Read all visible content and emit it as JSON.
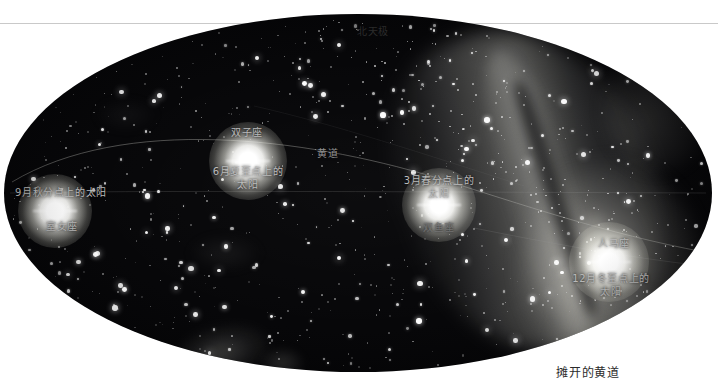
{
  "figure": {
    "caption": "摊开的黄道",
    "projection_outline": "ellipse",
    "background_color": "#ffffff",
    "sky_color": "#040406"
  },
  "poles": {
    "north_label": "北天极",
    "south_label": "南天极"
  },
  "ecliptic": {
    "label": "黄道"
  },
  "markers": [
    {
      "id": "sun-jun",
      "icon": "sun-icon",
      "constellation": "双子座",
      "label": "6月夏至点上的\n太阳",
      "label_flat": "6月夏至点上的太阳"
    },
    {
      "id": "sun-sep",
      "icon": "sun-icon",
      "constellation": "室女座",
      "label": "9月秋分点上的太阳",
      "label_flat": "9月秋分点上的太阳"
    },
    {
      "id": "sun-mar",
      "icon": "sun-icon",
      "constellation": "双鱼座",
      "label": "3月春分点上的\n太阳",
      "label_flat": "3月春分点上的太阳"
    },
    {
      "id": "sun-dec",
      "icon": "sun-icon",
      "constellation": "人马座",
      "label": "12月冬至点上的\n太阳",
      "label_flat": "12月冬至点上的太阳"
    }
  ],
  "labels": {
    "north_pole": "北天极",
    "south_pole": "南天极",
    "ecliptic": "黄道",
    "gemini": "双子座",
    "virgo": "室女座",
    "pisces": "双鱼座",
    "sagittarius": "人马座",
    "sun_june": "6月夏至点上的\n太阳",
    "sun_september": "9月秋分点上的太阳",
    "sun_march": "3月春分点上的\n太阳",
    "sun_december": "12月冬至点上的\n太阳",
    "caption": "摊开的黄道"
  },
  "colors": {
    "sky": "#040406",
    "page": "#ffffff",
    "label_text": "#b9b9b9",
    "caption_text": "#2b2b2b",
    "rule": "#c9c9c9",
    "milky_way": "#cdcdc6",
    "sun_core": "#ffffff"
  }
}
